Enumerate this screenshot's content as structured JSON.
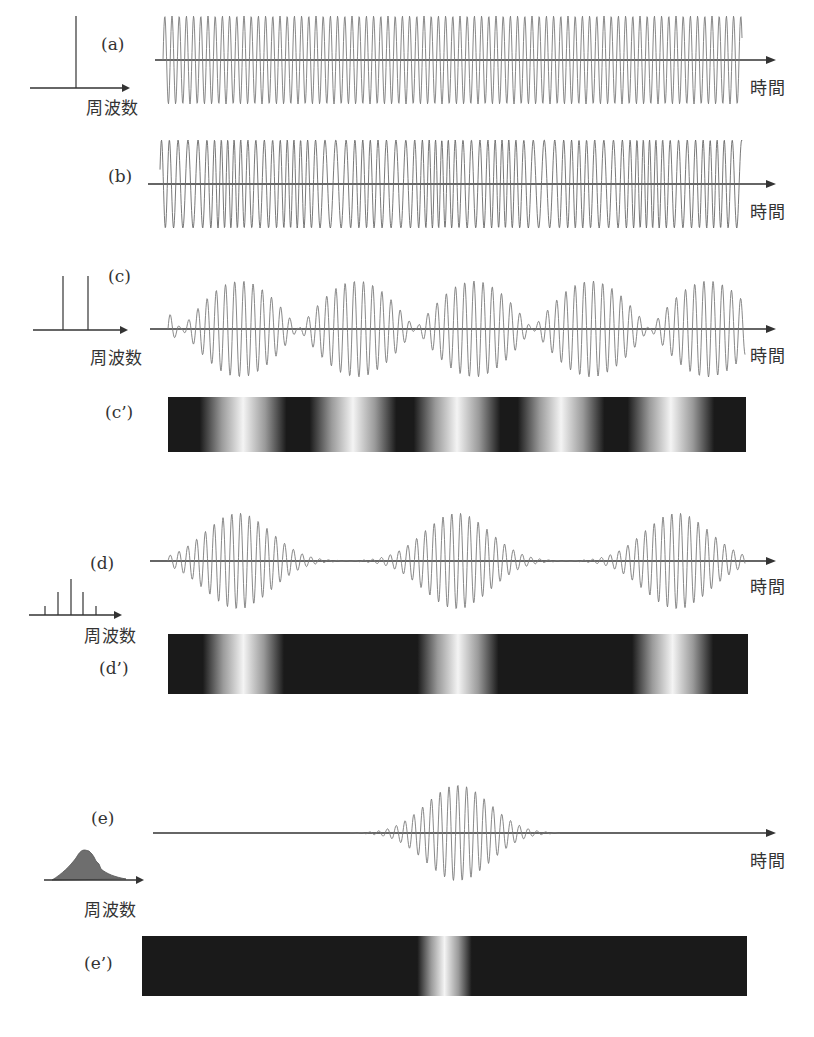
{
  "panels": [
    {
      "id": "a",
      "label": "(a)",
      "description": "single frequency continuous wave",
      "spectrum": "single-line",
      "time_axis_label": "時間",
      "freq_axis_label": "周波数"
    },
    {
      "id": "b",
      "label": "(b)",
      "description": "random multi-frequency wave",
      "time_axis_label": "時間"
    },
    {
      "id": "c",
      "label": "(c)",
      "description": "two-frequency beat",
      "spectrum": "two-lines",
      "time_axis_label": "時間",
      "freq_axis_label": "周波数"
    },
    {
      "id": "c2",
      "label": "(c’)",
      "description": "intensity pattern of (c)",
      "bright_positions": [
        0.13,
        0.32,
        0.5,
        0.68,
        0.87
      ]
    },
    {
      "id": "d",
      "label": "(d)",
      "description": "five-frequency pulse train",
      "spectrum": "five-lines",
      "time_axis_label": "時間",
      "freq_axis_label": "周波数"
    },
    {
      "id": "d2",
      "label": "(d’)",
      "description": "intensity pattern of (d)",
      "bright_positions": [
        0.13,
        0.5,
        0.87
      ]
    },
    {
      "id": "e",
      "label": "(e)",
      "description": "continuous spectrum single pulse",
      "spectrum": "continuous",
      "time_axis_label": "時間",
      "freq_axis_label": "周波数"
    },
    {
      "id": "e2",
      "label": "(e’)",
      "description": "intensity pattern of (e)",
      "bright_positions": [
        0.5
      ]
    }
  ],
  "colors": {
    "wave": "#7a7a7a",
    "axis": "#333333",
    "band_dark": "#1a1a1a",
    "band_light": "#f4f4f4",
    "spectrum_fill": "#6e6e6e"
  }
}
